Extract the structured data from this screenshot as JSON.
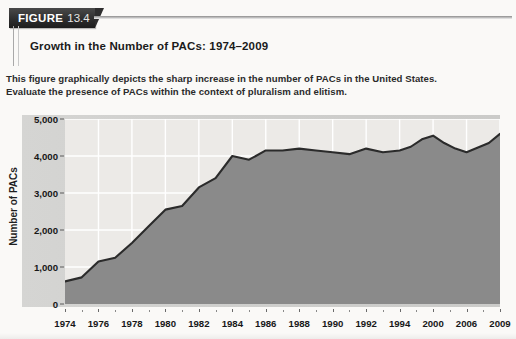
{
  "figure": {
    "tag_label": "FIGURE",
    "tag_number": "13.4",
    "title": "Growth in the Number of PACs: 1974–2009",
    "description_line1": "This figure graphically depicts the sharp increase in the number of PACs in the United States.",
    "description_line2": "Evaluate the presence of PACs within the context of pluralism and elitism."
  },
  "colors": {
    "tag_background": "#2e2e2e",
    "tag_text": "#ffffff",
    "area_fill": "#8a8a8a",
    "area_line": "#2b2b2b",
    "plot_background": "#eceae7",
    "panel_background": "#d2d2d0",
    "gridline": "#ffffff"
  },
  "chart_data": {
    "type": "area",
    "title": "Growth in the Number of PACs: 1974–2009",
    "xlabel": "",
    "ylabel": "Number of PACs",
    "ylim": [
      0,
      5000
    ],
    "ytick_labels": [
      "0",
      "1,000",
      "2,000",
      "3,000",
      "4,000",
      "5,000"
    ],
    "ytick_values": [
      0,
      1000,
      2000,
      3000,
      4000,
      5000
    ],
    "xtick_labels": [
      "1974",
      "1976",
      "1978",
      "1980",
      "1982",
      "1984",
      "1986",
      "1988",
      "1990",
      "1992",
      "1994",
      "2000",
      "2006",
      "2009"
    ],
    "grid": true,
    "legend": "none",
    "categories": [
      "1974",
      "1975",
      "1976",
      "1977",
      "1978",
      "1979",
      "1980",
      "1981",
      "1982",
      "1983",
      "1984",
      "1985",
      "1986",
      "1987",
      "1988",
      "1989",
      "1990",
      "1991",
      "1992",
      "1993",
      "1994",
      "1996",
      "1998",
      "2000",
      "2002",
      "2004",
      "2006",
      "2008",
      "2009"
    ],
    "values": [
      610,
      720,
      1150,
      1250,
      1650,
      2100,
      2550,
      2650,
      3150,
      3400,
      4000,
      3900,
      4150,
      4150,
      4200,
      4150,
      4100,
      4050,
      4200,
      4100,
      4150,
      4250,
      4450,
      4550,
      4350,
      4200,
      4100,
      4350,
      4600
    ]
  }
}
